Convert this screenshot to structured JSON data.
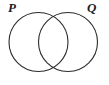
{
  "figure": {
    "type": "venn-diagram",
    "width": 109,
    "height": 85,
    "background_color": "#ffffff",
    "stroke_color": "#2b2b2b",
    "stroke_width": 1.1,
    "fill": "none"
  },
  "sets": [
    {
      "id": "left",
      "label": "P",
      "label_position": "top-left",
      "center_x": 38.5,
      "center_y": 42,
      "radius": 29.5
    },
    {
      "id": "right",
      "label": "Q",
      "label_position": "top-right",
      "center_x": 68.0,
      "center_y": 42,
      "radius": 29.5
    }
  ],
  "intersection": {
    "shape": "lens",
    "upper_point_x": 53,
    "upper_point_y": 15,
    "lower_point_x": 53,
    "lower_point_y": 71,
    "shaded": false
  }
}
